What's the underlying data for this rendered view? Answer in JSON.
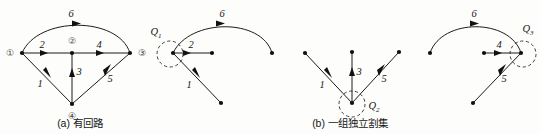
{
  "figure": {
    "background_color": "#fdfdfb",
    "ink_color": "#161616",
    "panels": [
      {
        "id": "panel-a",
        "caption": "(a) 有回路",
        "caption_label": "(a)",
        "caption_text": "有回路",
        "nodes": [
          {
            "id": "n1",
            "label": "①",
            "ringed": true
          },
          {
            "id": "n2",
            "label": "②",
            "ringed": true
          },
          {
            "id": "n3",
            "label": "③",
            "ringed": true
          },
          {
            "id": "n4",
            "label": "④",
            "ringed": true
          }
        ],
        "edges": [
          {
            "label": "1",
            "from": "n1",
            "to": "n4"
          },
          {
            "label": "2",
            "from": "n1",
            "to": "n2"
          },
          {
            "label": "3",
            "from": "n4",
            "to": "n2"
          },
          {
            "label": "4",
            "from": "n2",
            "to": "n3"
          },
          {
            "label": "5",
            "from": "n4",
            "to": "n3"
          },
          {
            "label": "6",
            "from": "n1",
            "to": "n3",
            "shape": "arc"
          }
        ],
        "cut_sets": []
      },
      {
        "id": "panel-b-left",
        "caption": "",
        "nodes": [
          {
            "id": "m1",
            "label": "",
            "ringed": false
          },
          {
            "id": "m2",
            "label": "",
            "ringed": false
          },
          {
            "id": "m3",
            "label": "",
            "ringed": false
          },
          {
            "id": "m4",
            "label": "",
            "ringed": false
          }
        ],
        "edges": [
          {
            "label": "1",
            "from": "m1",
            "to": "m4"
          },
          {
            "label": "2",
            "from": "m1",
            "to": "m2"
          },
          {
            "label": "6",
            "from": "m1",
            "to": "m3",
            "shape": "arc"
          }
        ],
        "cut_sets": [
          {
            "label": "Q",
            "subscript": "1",
            "encircles": "m1",
            "edges": [
              "1",
              "2",
              "6"
            ]
          }
        ]
      },
      {
        "id": "panel-b-middle",
        "caption": "(b) 一组独立割集",
        "caption_label": "(b)",
        "caption_text": "一组独立割集",
        "nodes": [
          {
            "id": "p1",
            "label": "",
            "ringed": false
          },
          {
            "id": "p2",
            "label": "",
            "ringed": false
          },
          {
            "id": "p3",
            "label": "",
            "ringed": false
          },
          {
            "id": "p4",
            "label": "",
            "ringed": false
          }
        ],
        "edges": [
          {
            "label": "1",
            "from": "p1",
            "to": "p4"
          },
          {
            "label": "3",
            "from": "p4",
            "to": "p2"
          },
          {
            "label": "5",
            "from": "p4",
            "to": "p3"
          }
        ],
        "cut_sets": [
          {
            "label": "Q",
            "subscript": "2",
            "encircles": "p4",
            "edges": [
              "1",
              "3",
              "5"
            ]
          }
        ]
      },
      {
        "id": "panel-b-right",
        "caption": "",
        "nodes": [
          {
            "id": "r1",
            "label": "",
            "ringed": false
          },
          {
            "id": "r2",
            "label": "",
            "ringed": false
          },
          {
            "id": "r3",
            "label": "",
            "ringed": false
          },
          {
            "id": "r4",
            "label": "",
            "ringed": false
          }
        ],
        "edges": [
          {
            "label": "4",
            "from": "r2",
            "to": "r3"
          },
          {
            "label": "5",
            "from": "r4",
            "to": "r3"
          },
          {
            "label": "6",
            "from": "r1",
            "to": "r3",
            "shape": "arc"
          }
        ],
        "cut_sets": [
          {
            "label": "Q",
            "subscript": "3",
            "encircles": "r3",
            "edges": [
              "4",
              "5",
              "6"
            ]
          }
        ]
      }
    ],
    "labels": {
      "edge_1": "1",
      "edge_2": "2",
      "edge_3": "3",
      "edge_4": "4",
      "edge_5": "5",
      "edge_6": "6",
      "node_1": "①",
      "node_2": "②",
      "node_3": "③",
      "node_4": "④",
      "q_base": "Q",
      "q1_sub": "1",
      "q2_sub": "2",
      "q3_sub": "3",
      "caption_a": "(a) 有回路",
      "caption_b": "(b) 一组独立割集"
    }
  }
}
